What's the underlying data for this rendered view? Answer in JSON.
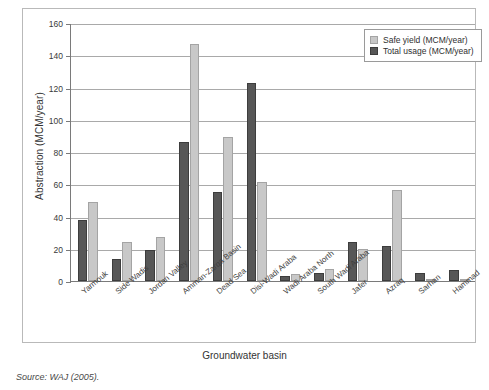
{
  "chart_data": {
    "type": "bar",
    "title": "",
    "xlabel": "Groundwater basin",
    "ylabel": "Abstraction (MCM/year)",
    "ylim": [
      0,
      160
    ],
    "ytick_step": 20,
    "yticks": [
      0,
      20,
      40,
      60,
      80,
      100,
      120,
      140,
      160
    ],
    "grid": true,
    "legend_position": "top-right",
    "categories": [
      "Yarmouk",
      "Side Wadis",
      "Jordan Valley",
      "Amman-Zarqa Basin",
      "Dead Sea",
      "Disi-Wadi Araba",
      "Wadi Araba North",
      "South Wadi Araba",
      "Jafer",
      "Azraq",
      "Sarhan",
      "Hammad"
    ],
    "series": [
      {
        "name": "Total usage (MCM/year)",
        "color": "#575757",
        "values": [
          38,
          13.5,
          19,
          86,
          55,
          123,
          3,
          5,
          24.5,
          22,
          5,
          7
        ]
      },
      {
        "name": "Safe yield (MCM/year)",
        "color": "#c8c8c8",
        "values": [
          49,
          24,
          27,
          147,
          89.5,
          61.5,
          4.5,
          7.5,
          20,
          56.5,
          1,
          0.8
        ]
      }
    ]
  },
  "legend": {
    "items": [
      {
        "label": "Safe yield (MCM/year)",
        "swatch": "safe"
      },
      {
        "label": "Total usage (MCM/year)",
        "swatch": "total"
      }
    ]
  },
  "caption": {
    "source": "Source: WAJ (2005)."
  },
  "colors": {
    "total_usage": "#575757",
    "safe_yield": "#c8c8c8",
    "axis": "#7a7a7a",
    "grid": "#a9a9a9",
    "frame": "#b9b9b9"
  }
}
